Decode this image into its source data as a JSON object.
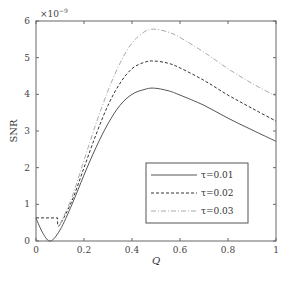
{
  "chart_data": {
    "type": "line",
    "title": "",
    "xlabel": "Q",
    "ylabel": "SNR",
    "y_scale_note": "×10⁻⁹",
    "xlim": [
      0,
      1
    ],
    "ylim": [
      0,
      6
    ],
    "xticks": [
      "0",
      "0.2",
      "0.4",
      "0.6",
      "0.8",
      "1"
    ],
    "yticks": [
      "0",
      "1",
      "2",
      "3",
      "4",
      "5",
      "6"
    ],
    "grid": false,
    "legend_position": "lower right",
    "x": [
      0,
      0.03,
      0.06,
      0.1,
      0.15,
      0.2,
      0.25,
      0.3,
      0.35,
      0.4,
      0.45,
      0.49,
      0.55,
      0.6,
      0.7,
      0.8,
      0.9,
      1.0
    ],
    "series": [
      {
        "name": "τ=0.01",
        "style": "solid",
        "values": [
          0.62,
          0.2,
          0.0,
          0.3,
          1.0,
          1.8,
          2.55,
          3.2,
          3.7,
          4.0,
          4.13,
          4.17,
          4.1,
          3.98,
          3.7,
          3.35,
          3.03,
          2.72
        ]
      },
      {
        "name": "τ=0.02",
        "style": "dashed",
        "values": [
          0.63,
          0.63,
          0.63,
          0.45,
          1.1,
          2.0,
          2.9,
          3.7,
          4.3,
          4.7,
          4.87,
          4.91,
          4.85,
          4.72,
          4.38,
          3.98,
          3.62,
          3.27
        ]
      },
      {
        "name": "τ=0.03",
        "style": "dash-dot",
        "values": [
          null,
          null,
          null,
          0.45,
          1.2,
          2.2,
          3.2,
          4.1,
          4.85,
          5.4,
          5.7,
          5.78,
          5.7,
          5.55,
          5.15,
          4.7,
          4.3,
          3.95
        ]
      }
    ]
  },
  "labels": {
    "xlabel": "Q",
    "ylabel": "SNR",
    "exponent": "×10",
    "exponent_power": "−9",
    "xticks": [
      "0",
      "0.2",
      "0.4",
      "0.6",
      "0.8",
      "1"
    ],
    "yticks": [
      "0",
      "1",
      "2",
      "3",
      "4",
      "5",
      "6"
    ],
    "legend": [
      "τ=0.01",
      "τ=0.02",
      "τ=0.03"
    ]
  },
  "colors": {
    "axis": "#555555",
    "series1": "#555555",
    "series2": "#333333",
    "series3": "#aaaaaa"
  }
}
